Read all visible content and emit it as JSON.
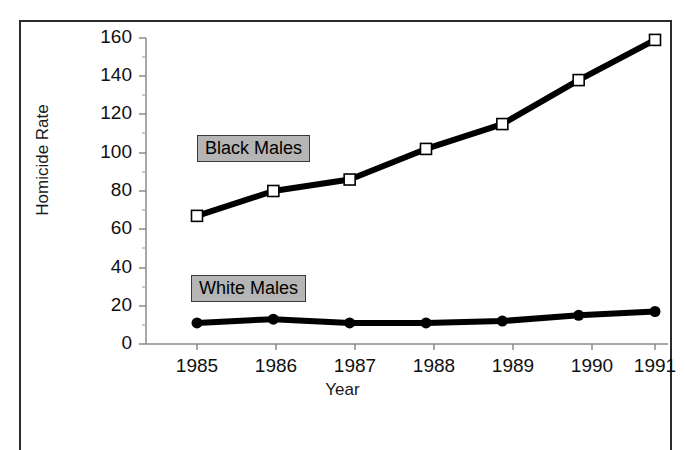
{
  "figure": {
    "top_caption": "",
    "frame_color": "#2b2b2b",
    "background": "#ffffff"
  },
  "legend": {
    "black_males": "Black Males",
    "white_males": "White Males",
    "box_fill": "#b5b5b5",
    "box_border": "#3a3a3a"
  },
  "axes": {
    "ylabel": "Homicide Rate",
    "xlabel": "Year",
    "ytick_labels": [
      "160",
      "140",
      "120",
      "100",
      "80",
      "60",
      "40",
      "20",
      "0"
    ],
    "xtick_labels": [
      "1985",
      "1986",
      "1987",
      "1988",
      "1989",
      "1990",
      "1991"
    ]
  },
  "chart_data": {
    "type": "line",
    "title": "",
    "xlabel": "Year",
    "ylabel": "Homicide Rate",
    "x": [
      1985,
      1986,
      1987,
      1988,
      1989,
      1990,
      1991
    ],
    "categories": [
      "1985",
      "1986",
      "1987",
      "1988",
      "1989",
      "1990",
      "1991"
    ],
    "series": [
      {
        "name": "Black Males",
        "values": [
          67,
          80,
          86,
          102,
          115,
          138,
          159
        ],
        "marker": "open-square",
        "color": "#000000"
      },
      {
        "name": "White Males",
        "values": [
          11,
          13,
          11,
          11,
          12,
          15,
          17
        ],
        "marker": "filled-circle",
        "color": "#000000"
      }
    ],
    "ylim": [
      0,
      160
    ],
    "ytick_step": 20,
    "yminor_tick_step": 10,
    "xlim": [
      1985,
      1991
    ],
    "grid": false,
    "legend_position": "inline-annotations"
  }
}
